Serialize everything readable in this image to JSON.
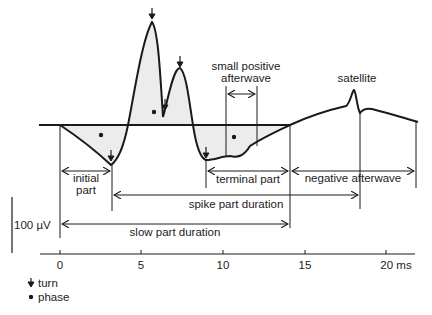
{
  "diagram": {
    "labels": {
      "small_positive_afterwave_line1": "small positive",
      "small_positive_afterwave_line2": "afterwave",
      "satellite": "satellite",
      "initial_part_line1": "initial",
      "initial_part_line2": "part",
      "terminal_part": "terminal part",
      "negative_afterwave": "negative afterwave",
      "spike_part_duration": "spike part duration",
      "slow_part_duration": "slow part duration",
      "scale_bar": "100 µV"
    },
    "axis": {
      "unit": "ms",
      "ticks": [
        "0",
        "5",
        "10",
        "15",
        "20 ms"
      ],
      "tick_values": [
        0,
        5,
        10,
        15,
        20
      ]
    },
    "legend": [
      {
        "icon": "arrow-down-icon",
        "label": "turn"
      },
      {
        "icon": "dot-icon",
        "label": "phase"
      }
    ],
    "colors": {
      "line": "#1a1a1a",
      "fill": "#ececec",
      "background": "#ffffff"
    }
  }
}
